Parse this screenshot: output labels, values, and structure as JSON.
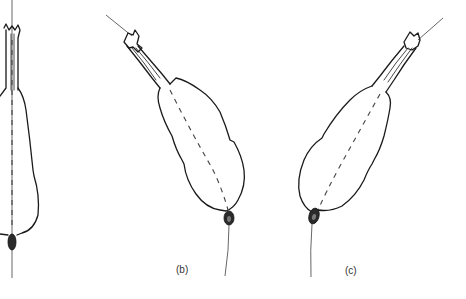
{
  "figure": {
    "background": "#ffffff",
    "line_color": "#1a1a1a",
    "panels": [
      {
        "id": "a",
        "label": "",
        "description": "vertical specimen, left edge (cropped)"
      },
      {
        "id": "b",
        "label": "(b)",
        "description": "specimen tilted, head upper-left"
      },
      {
        "id": "c",
        "label": "(c)",
        "description": "specimen tilted, head upper-right"
      }
    ]
  }
}
